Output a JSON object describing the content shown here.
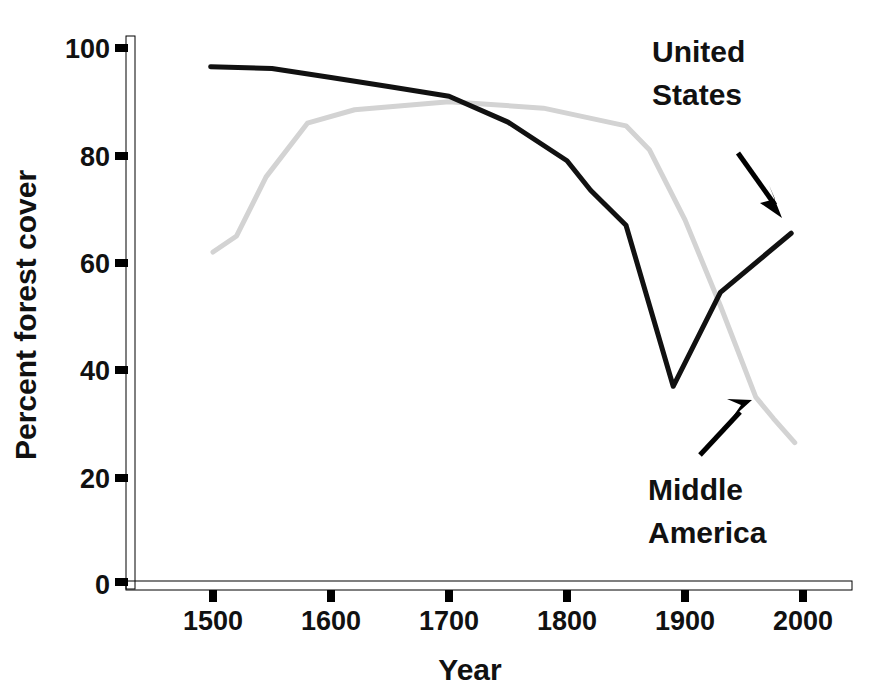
{
  "chart_data": {
    "type": "line",
    "title": "",
    "xlabel": "Year",
    "ylabel": "Percent forest cover",
    "xlim": [
      1430,
      2045
    ],
    "ylim": [
      0,
      103
    ],
    "xticks": [
      1500,
      1600,
      1700,
      1800,
      1900,
      2000
    ],
    "xtick_labels": [
      "1500",
      "1600",
      "1700",
      "1800",
      "1900",
      "2000"
    ],
    "yticks": [
      0,
      20,
      40,
      60,
      80,
      100
    ],
    "ytick_labels": [
      "0",
      "20",
      "40",
      "60",
      "80",
      "100"
    ],
    "grid": false,
    "legend": "annotations-with-arrows",
    "series": [
      {
        "name": "United States",
        "color": "#111111",
        "stroke_width": 5,
        "x": [
          1498,
          1550,
          1600,
          1650,
          1700,
          1750,
          1800,
          1820,
          1850,
          1890,
          1930,
          1990
        ],
        "values": [
          96.5,
          96.2,
          94.5,
          92.8,
          91.0,
          86.2,
          79.0,
          73.5,
          67.0,
          37.0,
          54.5,
          65.5
        ]
      },
      {
        "name": "Middle America",
        "color": "#d3d3d3",
        "stroke_width": 5,
        "x": [
          1500,
          1520,
          1545,
          1580,
          1620,
          1700,
          1780,
          1850,
          1870,
          1900,
          1930,
          1960,
          1975,
          1993
        ],
        "values": [
          62.0,
          65.0,
          76.0,
          86.0,
          88.5,
          90.0,
          88.8,
          85.5,
          81.0,
          68.0,
          52.0,
          35.0,
          31.0,
          26.5
        ]
      }
    ],
    "annotations": [
      {
        "id": "united-states",
        "label_lines": [
          "United",
          "States"
        ],
        "target_series": "United States",
        "arrow_direction": "down-right"
      },
      {
        "id": "middle-america",
        "label_lines": [
          "Middle",
          "America"
        ],
        "target_series": "Middle America",
        "arrow_direction": "up-right"
      }
    ]
  },
  "axes": {
    "y_title": "Percent forest cover",
    "x_title": "Year",
    "y_labels": [
      "100",
      "80",
      "60",
      "40",
      "20",
      "0"
    ],
    "x_labels": [
      "1500",
      "1600",
      "1700",
      "1800",
      "1900",
      "2000"
    ]
  },
  "annotations": {
    "us_line1": "United",
    "us_line2": "States",
    "ma_line1": "Middle",
    "ma_line2": "America"
  },
  "colors": {
    "axis": "#000000",
    "united_states_line": "#111111",
    "middle_america_line": "#d3d3d3",
    "text": "#111111",
    "background": "#ffffff"
  }
}
